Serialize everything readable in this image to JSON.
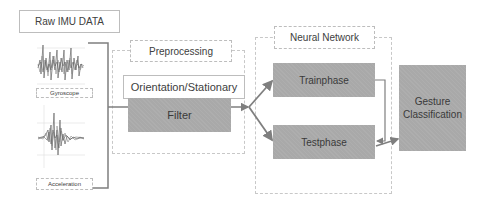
{
  "diagram": {
    "raw_data": {
      "title": "Raw IMU DATA"
    },
    "sensors": [
      {
        "label": "Gyroscope"
      },
      {
        "label": "Acceleration"
      }
    ],
    "preprocessing": {
      "title": "Preprocessing",
      "orientation_label": "Orientation/Stationary",
      "filter_label": "Filter"
    },
    "neural_network": {
      "title": "Neural Network",
      "train_label": "Trainphase",
      "test_label": "Testphase"
    },
    "output": {
      "label": "Gesture Classification"
    },
    "colors": {
      "process_fill": "#a9a9a9",
      "border": "#bdbdbd",
      "connector": "#7f7f7f"
    }
  }
}
